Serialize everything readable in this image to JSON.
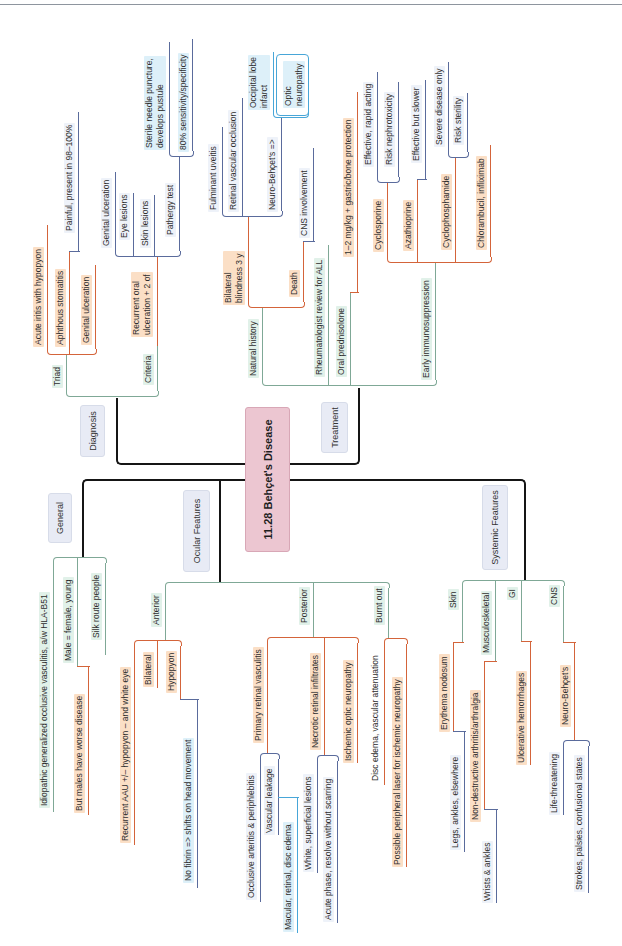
{
  "title": "11.28 Behçet's Disease",
  "diagnosis": {
    "label": "Diagnosis",
    "triad": {
      "label": "Triad",
      "items": [
        "Acute iritis with hypopyon",
        "Aphthous stomatitis",
        "Genital ulceration"
      ],
      "aphthous_note": "Painful, present in 98–100%"
    },
    "criteria": {
      "label": "Criteria",
      "rule": "Recurrent oral\nulceration + 2 of",
      "items": [
        "Genital ulceration",
        "Eye lesions",
        "Skin lesions",
        "Pathergy test"
      ],
      "pathergy_notes": [
        "Sterile needle puncture,\ndevelops pustule",
        "80% sensitivity/specificity"
      ]
    }
  },
  "treatment": {
    "label": "Treatment",
    "natural_history": {
      "label": "Natural history",
      "blindness": {
        "label": "Bilateral\nblindness 3 y",
        "causes": [
          "Fulminant uveitis",
          "Retinal vascular occlusion",
          "Neuro-Behçet's =>"
        ],
        "neuro_notes": [
          "Occipital lobe\ninfarct",
          "Optic\nneuropathy"
        ]
      },
      "death": {
        "label": "Death",
        "cause": "CNS involvement"
      }
    },
    "rheumatologist": "Rheumatologist review for ALL",
    "oral_prednisolone": {
      "label": "Oral prednisolone",
      "dose": "1–2 mg/kg + gastric/bone protection"
    },
    "early_immunosuppression": {
      "label": "Early immunosuppression",
      "drugs": [
        {
          "name": "Cyclosporine",
          "notes": [
            "Effective, rapid acting",
            "Risk nephrotoxicity"
          ]
        },
        {
          "name": "Azathioprine",
          "notes": [
            "Effective but slower"
          ]
        },
        {
          "name": "Cyclophosphamide",
          "notes": [
            "Severe disease only",
            "Risk sterility"
          ]
        },
        {
          "name": "Chlorambucil, infliximab",
          "notes": []
        }
      ]
    }
  },
  "general": {
    "label": "General",
    "items": [
      "Idiopathic generalized occlusive vasculitis, a/w HLA-B51",
      "Male = female, young",
      "Silk route people"
    ],
    "sex_note": "But males have worse disease"
  },
  "ocular": {
    "label": "Ocular Features",
    "anterior": {
      "label": "Anterior",
      "items": [
        "Recurrent AAU +/– hypopyon – and white eye",
        "Bilateral",
        "Hypopyon"
      ],
      "hypopyon_note": "No fibrin => shifts on head movement"
    },
    "posterior": {
      "label": "Posterior",
      "primary": {
        "label": "Primary retinal vasculitis",
        "notes": [
          "Occlusive arteritis & periphlebitis",
          "Vascular leakage"
        ],
        "leakage_note": "Macular, retinal, disc edema"
      },
      "necrotic": {
        "label": "Necrotic retinal infiltrates",
        "notes": [
          "White, superficial lesions",
          "Acute phase, resolve without scarring"
        ]
      },
      "ischemic": "Ischemic optic neuropathy"
    },
    "burnt_out": {
      "label": "Burnt out",
      "items": [
        "Disc edema, vascular attenuation",
        "Possible peripheral laser for ischemic neuropathy"
      ]
    }
  },
  "systemic": {
    "label": "Systemic Features",
    "skin": {
      "label": "Skin",
      "finding": "Erythema nodosum",
      "note": "Legs, ankles, elsewhere"
    },
    "musculoskeletal": {
      "label": "Musculoskeletal",
      "finding": "Non-destructive arthritis/arthralgia",
      "note": "Wrists & ankles"
    },
    "gi": {
      "label": "GI",
      "finding": "Ulcerative hemorrhages"
    },
    "cns": {
      "label": "CNS",
      "finding": "Neuro-Behçet's",
      "notes": [
        "Life-threatening",
        "Strokes, palsies, confusional states"
      ]
    }
  },
  "colors": {
    "central_node": "#ecc6d1",
    "branch_box": "#e8ebf5",
    "green_line": "#7fa896",
    "orange_line": "#d4643a",
    "blue_line": "#5a6b9c",
    "cyan_line": "#48a6d8",
    "peach_highlight": "#fbdfc6"
  }
}
